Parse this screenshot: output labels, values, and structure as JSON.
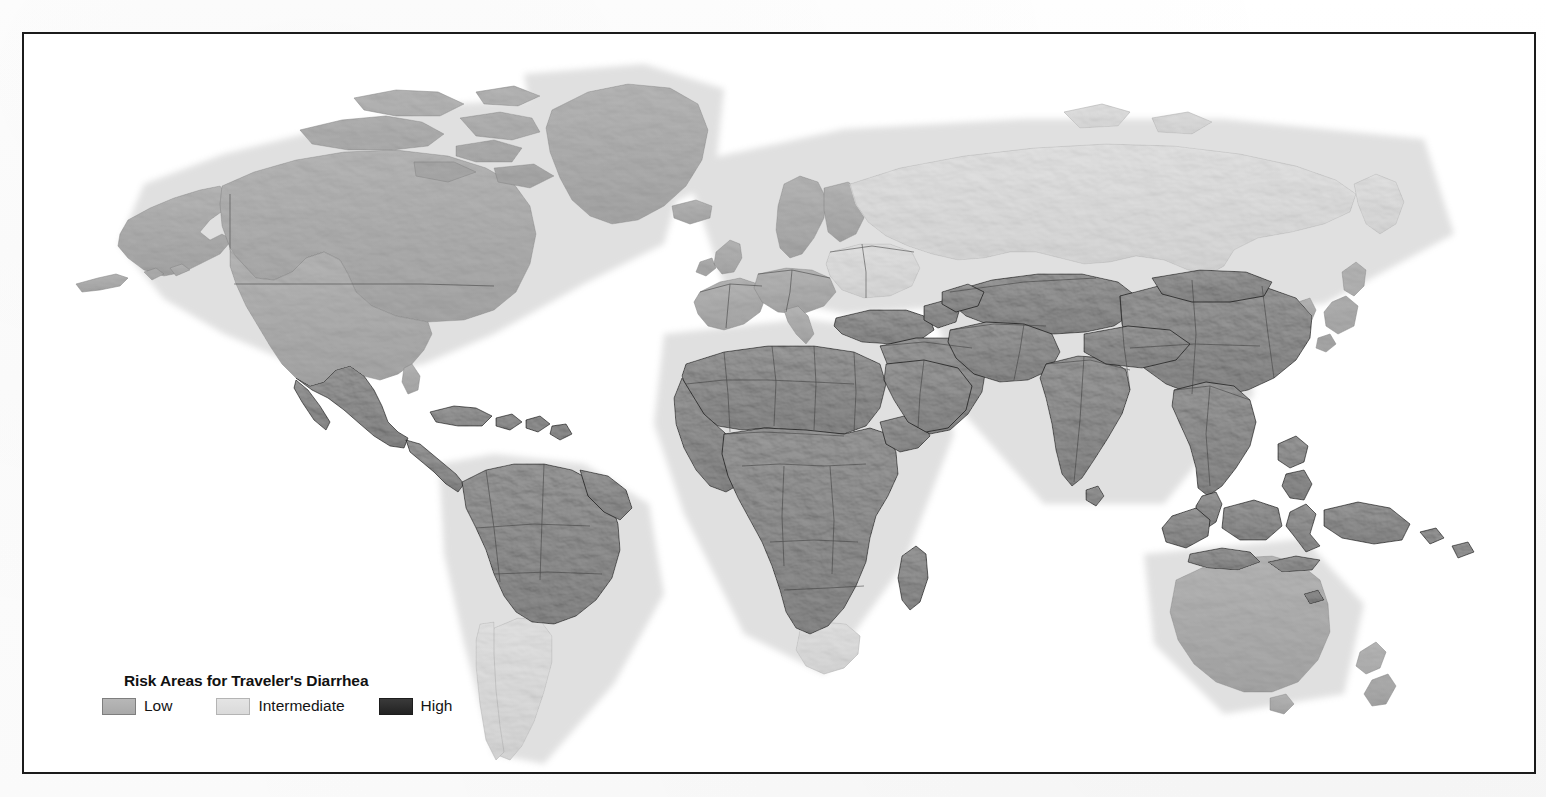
{
  "figure": {
    "kind": "thematic-world-map",
    "frame_border_color": "#1b1b1b",
    "background_color": "#ffffff"
  },
  "legend": {
    "title": "Risk Areas for Traveler's Diarrhea",
    "items": [
      {
        "key": "low",
        "label": "Low",
        "color": "#b0b0b0"
      },
      {
        "key": "intermediate",
        "label": "Intermediate",
        "color": "#dedede"
      },
      {
        "key": "high",
        "label": "High",
        "color": "#2a2a2a"
      }
    ]
  },
  "map_data": {
    "type": "choropleth",
    "projection": "equirectangular-ish",
    "risk_levels": [
      "Low",
      "Intermediate",
      "High"
    ],
    "regions": [
      {
        "name": "Canada",
        "risk": "Low"
      },
      {
        "name": "Alaska",
        "risk": "Low"
      },
      {
        "name": "United States",
        "risk": "Low"
      },
      {
        "name": "Greenland",
        "risk": "Low"
      },
      {
        "name": "Iceland",
        "risk": "Low"
      },
      {
        "name": "Mexico",
        "risk": "High"
      },
      {
        "name": "Central America",
        "risk": "High"
      },
      {
        "name": "Caribbean",
        "risk": "High"
      },
      {
        "name": "Northern South America",
        "risk": "High"
      },
      {
        "name": "Brazil",
        "risk": "High"
      },
      {
        "name": "Argentina",
        "risk": "Intermediate"
      },
      {
        "name": "Chile",
        "risk": "Intermediate"
      },
      {
        "name": "Western Europe",
        "risk": "Low"
      },
      {
        "name": "Northern Europe",
        "risk": "Low"
      },
      {
        "name": "Eastern Europe",
        "risk": "Intermediate"
      },
      {
        "name": "Russia",
        "risk": "Intermediate"
      },
      {
        "name": "Turkey",
        "risk": "High"
      },
      {
        "name": "Middle East",
        "risk": "High"
      },
      {
        "name": "Central Asia",
        "risk": "High"
      },
      {
        "name": "North Africa",
        "risk": "High"
      },
      {
        "name": "Sub-Saharan Africa",
        "risk": "High"
      },
      {
        "name": "South Africa",
        "risk": "Intermediate"
      },
      {
        "name": "Madagascar",
        "risk": "High"
      },
      {
        "name": "India",
        "risk": "High"
      },
      {
        "name": "China",
        "risk": "High"
      },
      {
        "name": "Mongolia",
        "risk": "High"
      },
      {
        "name": "Southeast Asia",
        "risk": "High"
      },
      {
        "name": "Indonesia",
        "risk": "High"
      },
      {
        "name": "Philippines",
        "risk": "High"
      },
      {
        "name": "Papua New Guinea",
        "risk": "High"
      },
      {
        "name": "Japan",
        "risk": "Low"
      },
      {
        "name": "South Korea",
        "risk": "Low"
      },
      {
        "name": "Australia",
        "risk": "Low"
      },
      {
        "name": "New Zealand",
        "risk": "Low"
      }
    ]
  }
}
